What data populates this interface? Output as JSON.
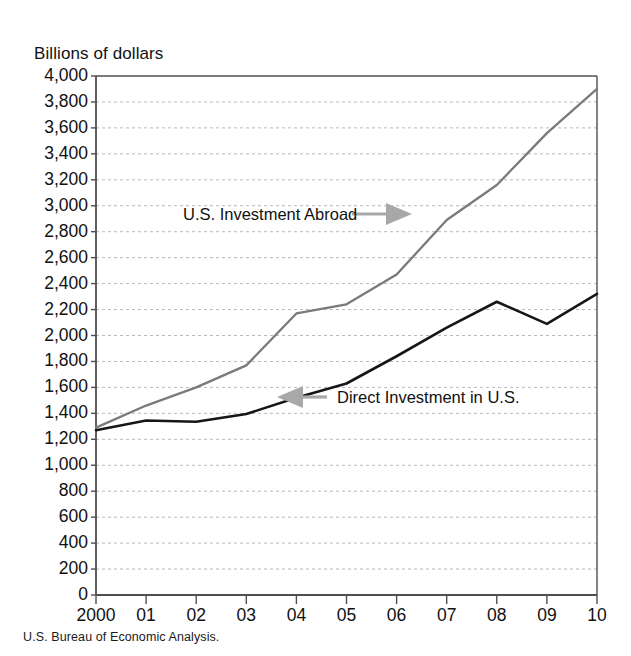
{
  "chart_data": {
    "type": "line",
    "title": "",
    "ylabel": "Billions of dollars",
    "xlabel": "",
    "ylim": [
      0,
      4000
    ],
    "ytick_step": 200,
    "grid": true,
    "legend_position": "inline-annotations",
    "x": [
      "2000",
      "01",
      "02",
      "03",
      "04",
      "05",
      "06",
      "07",
      "08",
      "09",
      "10"
    ],
    "xtick_labels": [
      "2000",
      "01",
      "02",
      "03",
      "04",
      "05",
      "06",
      "07",
      "08",
      "09",
      "10"
    ],
    "ytick_labels": [
      "4,000",
      "3,800",
      "3,600",
      "3,400",
      "3,200",
      "3,000",
      "2,800",
      "2,600",
      "2,400",
      "2,200",
      "2,000",
      "1,800",
      "1,600",
      "1,400",
      "1,200",
      "1,000",
      "800",
      "600",
      "400",
      "200",
      "0"
    ],
    "ytick_values": [
      4000,
      3800,
      3600,
      3400,
      3200,
      3000,
      2800,
      2600,
      2400,
      2200,
      2000,
      1800,
      1600,
      1400,
      1200,
      1000,
      800,
      600,
      400,
      200,
      0
    ],
    "series": [
      {
        "name": "U.S. Investment Abroad",
        "color": "#7a7a7a",
        "values": [
          1290,
          1460,
          1600,
          1770,
          2170,
          2240,
          2470,
          2890,
          3160,
          3560,
          3900
        ]
      },
      {
        "name": "Direct Investment in U.S.",
        "color": "#161616",
        "values": [
          1270,
          1345,
          1335,
          1395,
          1520,
          1630,
          1840,
          2060,
          2260,
          2090,
          2320
        ]
      }
    ],
    "annotations": [
      {
        "id": "us-investment-abroad",
        "text": "U.S. Investment Abroad",
        "arrow": "right"
      },
      {
        "id": "direct-investment-in-us",
        "text": "Direct Investment in U.S.",
        "arrow": "left"
      }
    ],
    "source": "U.S. Bureau of Economic Analysis."
  },
  "colors": {
    "series_abroad": "#7a7a7a",
    "series_inbound": "#161616",
    "arrow": "#a8a8a8",
    "grid": "#b9b9b9",
    "axis": "#4f4f4f"
  }
}
